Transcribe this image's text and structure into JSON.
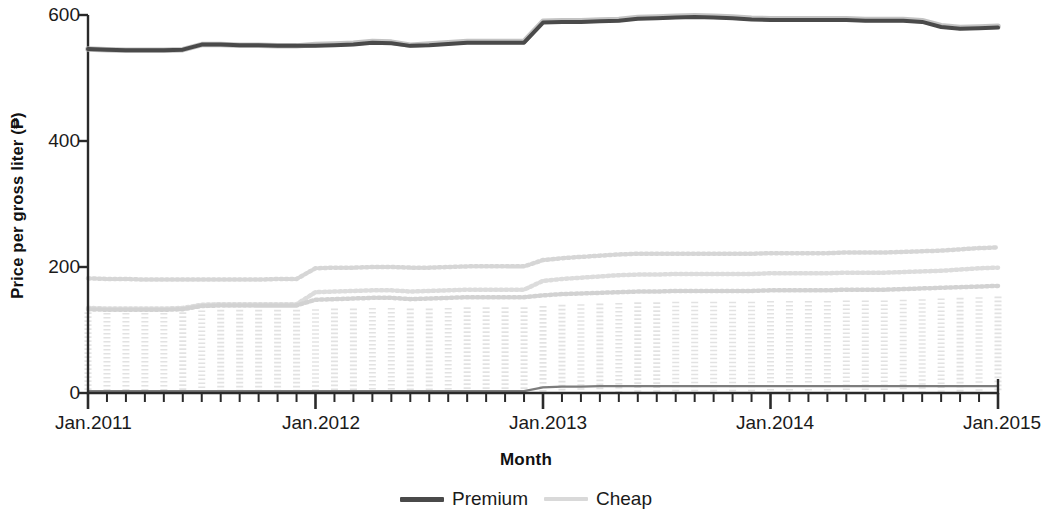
{
  "chart_data": {
    "type": "line",
    "title": "",
    "xlabel": "Month",
    "ylabel": "Price per gross liter (₱)",
    "ylim": [
      0,
      620
    ],
    "yticks": [
      0,
      200,
      400,
      600
    ],
    "ytick_labels": [
      "0",
      "200",
      "400",
      "600"
    ],
    "xlim": [
      "Jan.2011",
      "Jan.2015"
    ],
    "xticks": [
      "Jan.2011",
      "Jan.2012",
      "Jan.2013",
      "Jan.2014",
      "Jan.2015"
    ],
    "xtick_minor_interval": "1 month",
    "grid": false,
    "legend_position": "bottom-center",
    "x": [
      "Jan.2011",
      "Feb.2011",
      "Mar.2011",
      "Apr.2011",
      "May.2011",
      "Jun.2011",
      "Jul.2011",
      "Aug.2011",
      "Sep.2011",
      "Oct.2011",
      "Nov.2011",
      "Dec.2011",
      "Jan.2012",
      "Feb.2012",
      "Mar.2012",
      "Apr.2012",
      "May.2012",
      "Jun.2012",
      "Jul.2012",
      "Aug.2012",
      "Sep.2012",
      "Oct.2012",
      "Nov.2012",
      "Dec.2012",
      "Jan.2013",
      "Feb.2013",
      "Mar.2013",
      "Apr.2013",
      "May.2013",
      "Jun.2013",
      "Jul.2013",
      "Aug.2013",
      "Sep.2013",
      "Oct.2013",
      "Nov.2013",
      "Dec.2013",
      "Jan.2014",
      "Feb.2014",
      "Mar.2014",
      "Apr.2014",
      "May.2014",
      "Jun.2014",
      "Jul.2014",
      "Aug.2014",
      "Sep.2014",
      "Oct.2014",
      "Nov.2014",
      "Dec.2014",
      "Jan.2015"
    ],
    "series": [
      {
        "name": "Premium",
        "color": "#4a4a4a",
        "style": "solid",
        "values": [
          546,
          545,
          544,
          544,
          544,
          545,
          553,
          553,
          552,
          552,
          551,
          551,
          551,
          552,
          553,
          556,
          555,
          551,
          552,
          554,
          556,
          556,
          556,
          556,
          588,
          589,
          589,
          590,
          591,
          594,
          595,
          596,
          597,
          596,
          595,
          593,
          592,
          592,
          592,
          592,
          592,
          591,
          591,
          591,
          589,
          581,
          578,
          579,
          580
        ]
      },
      {
        "name": "Cheap",
        "color": "#b9b9b9",
        "style": "solid",
        "values": [
          546,
          545,
          544,
          544,
          544,
          545,
          553,
          553,
          552,
          552,
          551,
          551,
          553,
          554,
          555,
          558,
          557,
          552,
          554,
          556,
          558,
          558,
          558,
          558,
          590,
          591,
          591,
          592,
          593,
          596,
          597,
          598,
          599,
          598,
          597,
          595,
          594,
          594,
          594,
          594,
          594,
          593,
          593,
          593,
          591,
          583,
          580,
          581,
          582
        ]
      }
    ],
    "background_traces": {
      "note": "faint scan artifacts - residual light-gray dotted series",
      "upper_dotted": [
        182,
        181,
        181,
        180,
        180,
        180,
        180,
        180,
        180,
        180,
        181,
        181,
        198,
        199,
        199,
        200,
        200,
        199,
        199,
        200,
        201,
        201,
        201,
        201,
        211,
        214,
        216,
        218,
        220,
        221,
        221,
        221,
        221,
        221,
        221,
        221,
        222,
        222,
        222,
        222,
        223,
        223,
        223,
        224,
        225,
        226,
        228,
        230,
        231
      ],
      "mid_dotted": [
        135,
        134,
        134,
        134,
        134,
        135,
        140,
        141,
        141,
        141,
        141,
        141,
        160,
        161,
        162,
        163,
        163,
        161,
        162,
        163,
        164,
        164,
        164,
        164,
        178,
        181,
        183,
        185,
        187,
        188,
        188,
        189,
        189,
        189,
        189,
        189,
        190,
        190,
        190,
        190,
        191,
        191,
        191,
        192,
        193,
        194,
        196,
        198,
        199
      ],
      "lower_dotted": [
        133,
        132,
        132,
        132,
        132,
        133,
        138,
        139,
        139,
        139,
        139,
        139,
        148,
        149,
        150,
        151,
        151,
        149,
        150,
        151,
        152,
        152,
        152,
        152,
        155,
        157,
        158,
        159,
        160,
        161,
        161,
        162,
        162,
        162,
        162,
        162,
        163,
        163,
        163,
        163,
        164,
        164,
        164,
        165,
        166,
        167,
        168,
        169,
        170
      ],
      "baseline": [
        3,
        3,
        3,
        3,
        3,
        3,
        3,
        3,
        3,
        3,
        3,
        3,
        3,
        3,
        3,
        3,
        3,
        3,
        3,
        3,
        3,
        3,
        3,
        3,
        9,
        10,
        10,
        11,
        11,
        11,
        11,
        11,
        11,
        11,
        11,
        11,
        11,
        11,
        11,
        11,
        11,
        11,
        11,
        11,
        11,
        11,
        11,
        11,
        11
      ],
      "column_top": [
        128,
        127,
        127,
        127,
        127,
        128,
        131,
        132,
        132,
        132,
        132,
        132,
        133,
        134,
        134,
        135,
        135,
        134,
        134,
        135,
        136,
        136,
        136,
        136,
        138,
        140,
        141,
        142,
        143,
        144,
        144,
        145,
        145,
        145,
        145,
        145,
        146,
        146,
        146,
        146,
        147,
        147,
        147,
        148,
        149,
        150,
        151,
        152,
        153
      ]
    }
  },
  "legend": {
    "entries": [
      {
        "label": "Premium",
        "color": "#4a4a4a"
      },
      {
        "label": "Cheap",
        "color": "#b9b9b9"
      }
    ]
  },
  "axes": {
    "x_title": "Month",
    "y_title": "Price per gross liter (₱)"
  }
}
